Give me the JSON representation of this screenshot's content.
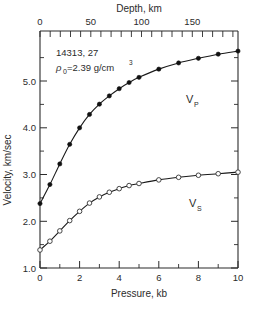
{
  "figure": {
    "sample_id": "14313, 27",
    "density_symbol": "ρ",
    "density_subscript": "0",
    "density_text": "=2.39  g/cm",
    "density_exponent": "3"
  },
  "axes": {
    "top": {
      "title": "Depth, km",
      "tick_labels": [
        "0",
        "50",
        "100",
        "150"
      ],
      "tick_values": [
        0,
        50,
        100,
        150
      ],
      "range": [
        0,
        195
      ]
    },
    "bottom": {
      "title": "Pressure,  kb",
      "tick_labels": [
        "0",
        "2",
        "4",
        "6",
        "8",
        "10"
      ],
      "tick_values": [
        0,
        2,
        4,
        6,
        8,
        10
      ],
      "range": [
        0,
        10
      ]
    },
    "left": {
      "title": "Velocity,  km/sec",
      "tick_labels": [
        "1.0",
        "2.0",
        "3.0",
        "4.0",
        "5.0"
      ],
      "tick_values": [
        1.0,
        2.0,
        3.0,
        4.0,
        5.0
      ],
      "range": [
        1.0,
        5.6
      ]
    }
  },
  "chart_data": {
    "type": "line",
    "title": "",
    "xlabel": "Pressure,  kb",
    "ylabel": "Velocity,  km/sec",
    "xlim": [
      0,
      10
    ],
    "ylim": [
      1.0,
      5.6
    ],
    "grid": false,
    "legend": "inline-labels",
    "secondary_x_axis": {
      "label": "Depth, km",
      "lim": [
        0,
        195
      ]
    },
    "annotations": [
      "14313, 27",
      "ρ0=2.39 g/cm3"
    ],
    "series": [
      {
        "name": "VP",
        "label": "V",
        "label_sub": "P",
        "marker": "filled-circle",
        "x": [
          0.0,
          0.5,
          1.0,
          1.5,
          2.0,
          2.5,
          3.0,
          3.5,
          4.0,
          4.5,
          5.0,
          6.0,
          7.0,
          8.0,
          9.0,
          10.0
        ],
        "values": [
          2.25,
          2.62,
          3.02,
          3.4,
          3.72,
          3.98,
          4.18,
          4.34,
          4.48,
          4.6,
          4.7,
          4.86,
          4.98,
          5.07,
          5.15,
          5.21
        ]
      },
      {
        "name": "VS",
        "label": "V",
        "label_sub": "S",
        "marker": "open-circle",
        "x": [
          0.0,
          0.5,
          1.0,
          1.5,
          2.0,
          2.5,
          3.0,
          3.5,
          4.0,
          4.5,
          5.0,
          6.0,
          7.0,
          8.0,
          9.0,
          10.0
        ],
        "values": [
          1.35,
          1.52,
          1.72,
          1.92,
          2.1,
          2.26,
          2.38,
          2.47,
          2.54,
          2.6,
          2.64,
          2.71,
          2.76,
          2.8,
          2.83,
          2.86
        ]
      }
    ]
  }
}
